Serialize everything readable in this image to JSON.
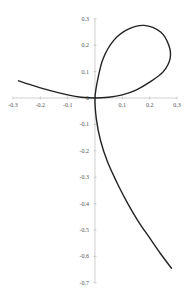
{
  "chart_data": {
    "type": "line",
    "title": "",
    "xlabel": "",
    "ylabel": "",
    "xlim": [
      -0.3,
      0.3
    ],
    "ylim": [
      -0.7,
      0.3
    ],
    "grid": false,
    "legend": null,
    "x_ticks": [
      "-0.3",
      "-0.2",
      "-0.1",
      "0",
      "0.1",
      "0.2",
      "0.3"
    ],
    "y_ticks": [
      "0.3",
      "0.2",
      "0.1",
      "0",
      "-0.1",
      "-0.2",
      "-0.3",
      "-0.4",
      "-0.5",
      "-0.6",
      "-0.7"
    ],
    "series": [
      {
        "name": "curve",
        "color": "#222222",
        "points": [
          [
            -0.28,
            0.065
          ],
          [
            -0.22,
            0.045
          ],
          [
            -0.16,
            0.027
          ],
          [
            -0.1,
            0.012
          ],
          [
            -0.05,
            0.003
          ],
          [
            0.0,
            0.0
          ],
          [
            0.05,
            0.003
          ],
          [
            0.1,
            0.012
          ],
          [
            0.15,
            0.03
          ],
          [
            0.2,
            0.06
          ],
          [
            0.25,
            0.1
          ],
          [
            0.275,
            0.15
          ],
          [
            0.27,
            0.2
          ],
          [
            0.24,
            0.25
          ],
          [
            0.18,
            0.275
          ],
          [
            0.12,
            0.26
          ],
          [
            0.07,
            0.22
          ],
          [
            0.03,
            0.15
          ],
          [
            0.01,
            0.07
          ],
          [
            0.0,
            0.0
          ],
          [
            0.005,
            -0.08
          ],
          [
            0.02,
            -0.16
          ],
          [
            0.045,
            -0.24
          ],
          [
            0.08,
            -0.32
          ],
          [
            0.12,
            -0.4
          ],
          [
            0.16,
            -0.47
          ],
          [
            0.2,
            -0.53
          ],
          [
            0.24,
            -0.59
          ],
          [
            0.28,
            -0.645
          ]
        ]
      }
    ]
  },
  "axis_color": "#bbbbbb",
  "label_color": "#555555"
}
